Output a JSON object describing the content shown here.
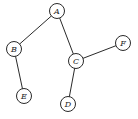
{
  "diagram": {
    "type": "undirected-graph",
    "node_radius": 7.5,
    "colors": {
      "stroke": "#2a2a2a",
      "fill": "#ffffff",
      "text": "#222222"
    },
    "nodes": [
      {
        "id": "A",
        "label": "A",
        "x": 57,
        "y": 11
      },
      {
        "id": "B",
        "label": "B",
        "x": 14,
        "y": 49
      },
      {
        "id": "C",
        "label": "C",
        "x": 76,
        "y": 61
      },
      {
        "id": "D",
        "label": "D",
        "x": 68,
        "y": 104
      },
      {
        "id": "E",
        "label": "E",
        "x": 24,
        "y": 96
      },
      {
        "id": "F",
        "label": "F",
        "x": 123,
        "y": 43
      }
    ],
    "edges": [
      {
        "from": "A",
        "to": "B"
      },
      {
        "from": "A",
        "to": "C"
      },
      {
        "from": "B",
        "to": "E"
      },
      {
        "from": "C",
        "to": "F"
      },
      {
        "from": "C",
        "to": "D"
      }
    ]
  }
}
